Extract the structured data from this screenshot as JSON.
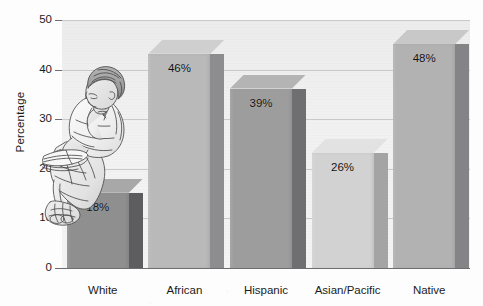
{
  "chart_data": {
    "type": "bar",
    "title": "",
    "subtitle": "",
    "xlabel": "",
    "ylabel": "Percentage",
    "categories": [
      "White",
      "African",
      "Hispanic",
      "Asian/Pacific",
      "Native"
    ],
    "values": [
      18,
      46,
      39,
      26,
      48
    ],
    "data_labels": [
      "18%",
      "46%",
      "39%",
      "26%",
      "48%"
    ],
    "ylim": [
      0,
      50
    ],
    "yticks": [
      0,
      10,
      20,
      30,
      40,
      50
    ],
    "ytick_labels": [
      "0",
      "10",
      "20",
      "30",
      "40",
      "50"
    ],
    "grid": true,
    "grid_axis": "y",
    "legend": false,
    "legend_position": "none",
    "style": "3d-bar-grayscale",
    "bar_colors": [
      "#8f8f90",
      "#b9b9ba",
      "#9d9d9e",
      "#d2d2d2",
      "#b2b2b3"
    ],
    "bar_side_colors": [
      "#5d5d5f",
      "#8d8d8f",
      "#6f6f71",
      "#a4a4a5",
      "#848486"
    ],
    "bar_top_colors": [
      "#a8a8a9",
      "#cfcfd0",
      "#b4b4b5",
      "#e2e2e2",
      "#c8c8c9"
    ],
    "plot_background": "#eeeeef",
    "axis_color": "#6e6e70",
    "gridline_color": "#c9c9cb",
    "text_color": "#1b1b1b"
  },
  "illustration": {
    "name": "seated-child-reading-book-sketch",
    "description": "pencil sketch of a seated child reading a book"
  }
}
